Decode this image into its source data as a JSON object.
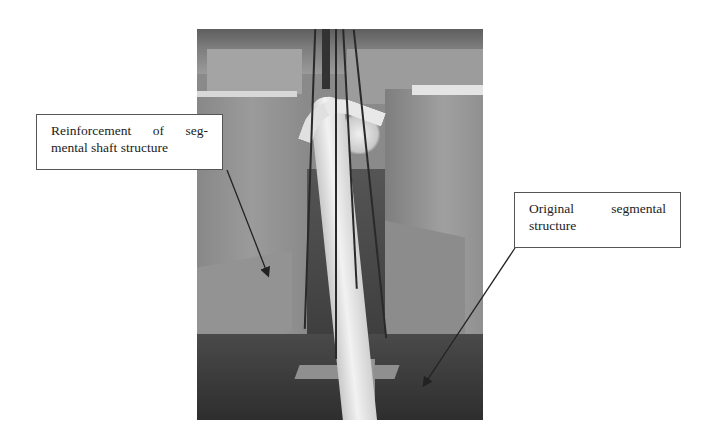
{
  "figure": {
    "photo_description": "Grayscale construction site photograph of a segmental shaft with a white pipe being lowered by crane cables",
    "callouts": [
      {
        "id": "reinforcement",
        "text": "Reinforcement of seg- mental shaft structure",
        "line1": "Reinforcement of seg-",
        "line2": "mental shaft structure"
      },
      {
        "id": "original",
        "text": "Original segmental structure",
        "line1": "Original segmental",
        "line2": "structure"
      }
    ],
    "colors": {
      "callout_border": "#555555",
      "callout_text": "#222222",
      "arrow": "#222222",
      "background": "#ffffff"
    }
  }
}
